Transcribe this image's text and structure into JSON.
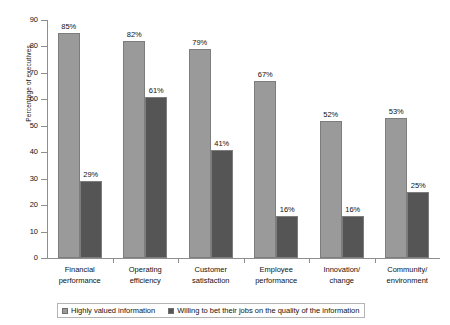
{
  "chart_data": {
    "type": "bar",
    "title": "",
    "xlabel": "",
    "ylabel": "Percentage of executives",
    "ylim": [
      0,
      90
    ],
    "ytick_step": 10,
    "yticks": [
      "0",
      "10",
      "20",
      "30",
      "40",
      "50",
      "60",
      "70",
      "80",
      "90"
    ],
    "grid": false,
    "legend_position": "bottom",
    "categories": [
      "Financial performance",
      "Operating efficiency",
      "Customer satisfaction",
      "Employee performance",
      "Innovation/ change",
      "Community/ environment"
    ],
    "category_lines": [
      [
        "Financial",
        "performance"
      ],
      [
        "Operating",
        "efficiency"
      ],
      [
        "Customer",
        "satisfaction"
      ],
      [
        "Employee",
        "performance"
      ],
      [
        "Innovation/",
        "change"
      ],
      [
        "Community/",
        "environment"
      ]
    ],
    "series": [
      {
        "name": "Highly valued information",
        "color": "#9a9a9a",
        "values": [
          85,
          82,
          79,
          67,
          52,
          53
        ],
        "labels": [
          "85%",
          "82%",
          "79%",
          "67%",
          "52%",
          "53%"
        ]
      },
      {
        "name": "Willing to bet their jobs on the quality of the information",
        "color": "#555555",
        "values": [
          29,
          61,
          41,
          16,
          16,
          25
        ],
        "labels": [
          "29%",
          "61%",
          "41%",
          "16%",
          "16%",
          "25%"
        ]
      }
    ]
  },
  "axis": {
    "y_title": "Percentage of executives"
  },
  "legend": {
    "items": [
      {
        "label": "Highly valued information"
      },
      {
        "label": "Willing to bet their jobs on the quality of the information"
      }
    ]
  }
}
